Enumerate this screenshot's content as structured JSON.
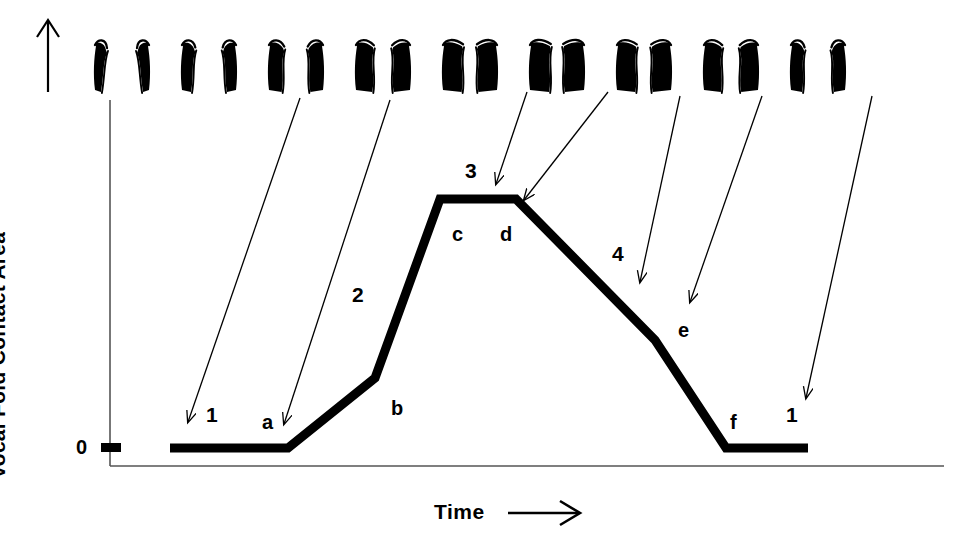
{
  "figure": {
    "background_color": "#ffffff",
    "ink_color": "#000000"
  },
  "axes": {
    "y_label": "Vocal Fold Contact Area",
    "y_arrow_icon": "up-arrow-icon",
    "x_label": "Time",
    "x_arrow_icon": "right-arrow-icon",
    "y_ticks": [
      {
        "value": "0",
        "y_px": 448
      }
    ]
  },
  "chart_data": {
    "type": "line",
    "title": "Vocal Fold Contact Area",
    "xlabel": "Time",
    "ylabel": "Vocal Fold Contact Area",
    "xlim": [
      0,
      100
    ],
    "ylim": [
      0,
      100
    ],
    "grid": false,
    "legend_position": "none",
    "line_width_px": 9,
    "line_color": "#000000",
    "x": [
      8.3,
      22.5,
      32.0,
      40.3,
      49.3,
      58.3,
      72.0,
      74.1,
      84.1
    ],
    "y": [
      0,
      0,
      21.5,
      100,
      100,
      100,
      36.5,
      0,
      0
    ],
    "vertices": [
      {
        "id": "start",
        "label": "",
        "x_px": 170,
        "y_px": 448
      },
      {
        "id": "a",
        "label": "a",
        "x_px": 288,
        "y_px": 448
      },
      {
        "id": "b",
        "label": "b",
        "x_px": 375,
        "y_px": 378
      },
      {
        "id": "c",
        "label": "c",
        "x_px": 440,
        "y_px": 199
      },
      {
        "id": "d",
        "label": "d",
        "x_px": 516,
        "y_px": 199
      },
      {
        "id": "e",
        "label": "e",
        "x_px": 655,
        "y_px": 340
      },
      {
        "id": "f",
        "label": "f",
        "x_px": 726,
        "y_px": 448
      },
      {
        "id": "end",
        "label": "",
        "x_px": 808,
        "y_px": 448
      }
    ],
    "point_labels": [
      {
        "text": "a",
        "x_px": 262,
        "y_px": 412
      },
      {
        "text": "b",
        "x_px": 391,
        "y_px": 398
      },
      {
        "text": "c",
        "x_px": 452,
        "y_px": 224
      },
      {
        "text": "d",
        "x_px": 500,
        "y_px": 224
      },
      {
        "text": "e",
        "x_px": 678,
        "y_px": 320
      },
      {
        "text": "f",
        "x_px": 730,
        "y_px": 412
      }
    ],
    "phase_labels": [
      {
        "text": "1",
        "x_px": 206,
        "y_px": 404
      },
      {
        "text": "2",
        "x_px": 352,
        "y_px": 284
      },
      {
        "text": "3",
        "x_px": 465,
        "y_px": 160
      },
      {
        "text": "4",
        "x_px": 612,
        "y_px": 243
      },
      {
        "text": "1",
        "x_px": 786,
        "y_px": 404
      }
    ]
  },
  "glottal_images": {
    "description": "Sequence of nine laryngeal (vocal fold) cross-section frames showing one glottal cycle",
    "count": 9,
    "frames": [
      {
        "index": 1,
        "name": "glottis-frame-open-1",
        "x_px": 122,
        "gap": 0.62,
        "apex": 0.0
      },
      {
        "index": 2,
        "name": "glottis-frame-closing-2",
        "x_px": 209,
        "gap": 0.5,
        "apex": 0.1
      },
      {
        "index": 3,
        "name": "glottis-frame-closing-3",
        "x_px": 296,
        "gap": 0.36,
        "apex": 0.25
      },
      {
        "index": 4,
        "name": "glottis-frame-contacting-4",
        "x_px": 383,
        "gap": 0.22,
        "apex": 0.45
      },
      {
        "index": 5,
        "name": "glottis-frame-contact-5",
        "x_px": 470,
        "gap": 0.13,
        "apex": 0.62
      },
      {
        "index": 6,
        "name": "glottis-frame-contact-6",
        "x_px": 557,
        "gap": 0.11,
        "apex": 0.68
      },
      {
        "index": 7,
        "name": "glottis-frame-opening-7",
        "x_px": 644,
        "gap": 0.14,
        "apex": 0.6
      },
      {
        "index": 8,
        "name": "glottis-frame-opening-8",
        "x_px": 731,
        "gap": 0.2,
        "apex": 0.48
      },
      {
        "index": 9,
        "name": "glottis-frame-open-9",
        "x_px": 818,
        "gap": 0.42,
        "apex": 0.12
      }
    ]
  },
  "annotation_arrows": {
    "description": "Thin leader lines from glottal frames down to points on the contact-area waveform",
    "arrows": [
      {
        "id": "arrow-to-1-left",
        "from_frame": 3,
        "x1": 300,
        "y1": 98,
        "x2": 188,
        "y2": 422
      },
      {
        "id": "arrow-to-a",
        "from_frame": 4,
        "x1": 390,
        "y1": 100,
        "x2": 284,
        "y2": 424
      },
      {
        "id": "arrow-to-3",
        "from_frame": 5,
        "x1": 527,
        "y1": 92,
        "x2": 496,
        "y2": 184
      },
      {
        "id": "arrow-to-d",
        "from_frame": 6,
        "x1": 608,
        "y1": 92,
        "x2": 524,
        "y2": 200
      },
      {
        "id": "arrow-to-4",
        "from_frame": 7,
        "x1": 680,
        "y1": 96,
        "x2": 640,
        "y2": 282
      },
      {
        "id": "arrow-to-e",
        "from_frame": 8,
        "x1": 762,
        "y1": 96,
        "x2": 690,
        "y2": 302
      },
      {
        "id": "arrow-to-1-right",
        "from_frame": 9,
        "x1": 872,
        "y1": 96,
        "x2": 806,
        "y2": 398
      }
    ]
  }
}
